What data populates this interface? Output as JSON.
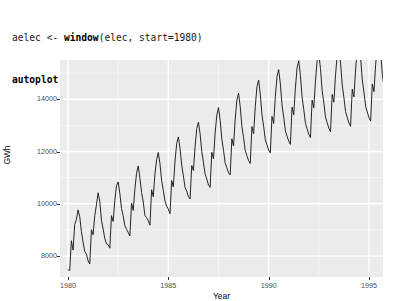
{
  "code": {
    "lines": [
      [
        {
          "t": "plain",
          "v": "aelec "
        },
        {
          "t": "op",
          "v": "<- "
        },
        {
          "t": "fn",
          "v": "window"
        },
        {
          "t": "plain",
          "v": "(elec, start=1980)"
        }
      ],
      [
        {
          "t": "fn",
          "v": "autoplot"
        },
        {
          "t": "plain",
          "v": "(aelec) "
        },
        {
          "t": "op",
          "v": "+ "
        },
        {
          "t": "fn",
          "v": "xlab"
        },
        {
          "t": "plain",
          "v": "("
        },
        {
          "t": "str",
          "v": "\"Year\""
        },
        {
          "t": "plain",
          "v": ") "
        },
        {
          "t": "op",
          "v": "+ "
        },
        {
          "t": "fn",
          "v": "ylab"
        },
        {
          "t": "plain",
          "v": "("
        },
        {
          "t": "str",
          "v": "\"GWh\""
        },
        {
          "t": "plain",
          "v": ")"
        }
      ]
    ],
    "line1_text": "aelec <- window(elec, start=1980)",
    "line2_text": "autoplot(aelec) + xlab(\"Year\") + ylab(\"GWh\")"
  },
  "colors": {
    "panel_background": "#ebebeb",
    "gridline_major": "#ffffff",
    "gridline_minor": "#f5f5f5",
    "series_line": "#1a1a1a",
    "axis_text": "#4d4d4d",
    "axis_title": "#000000",
    "code_string": "#9a9a9a",
    "code_text": "#1a1a1a",
    "page_background": "#ffffff"
  },
  "chart_data": {
    "type": "line",
    "title": "",
    "subtitle": "",
    "xlabel": "Year",
    "ylabel": "GWh",
    "xlim": [
      1979.6,
      1995.7
    ],
    "ylim": [
      7200,
      15500
    ],
    "xticks": [
      1980,
      1985,
      1990,
      1995
    ],
    "xtick_labels": [
      "1980",
      "1985",
      "1990",
      "1995"
    ],
    "yticks": [
      8000,
      10000,
      12000,
      14000
    ],
    "ytick_labels": [
      "8000",
      "10000",
      "12000",
      "14000"
    ],
    "xminor_ticks": [
      1982.5,
      1987.5,
      1992.5
    ],
    "yminor_ticks": [
      9000,
      11000,
      13000,
      15000
    ],
    "grid": true,
    "legend": "none",
    "theme": "theme_grey",
    "series": [
      {
        "name": "aelec",
        "color": "#1a1a1a",
        "x_start": 1980.0,
        "x_step": 0.0833333,
        "values": [
          7474,
          7454,
          8587,
          8230,
          9207,
          9405,
          9767,
          9507,
          8946,
          8537,
          8178,
          8078,
          7818,
          7697,
          9010,
          8818,
          9548,
          9961,
          10421,
          10087,
          9370,
          9035,
          8673,
          8472,
          8434,
          8301,
          9547,
          9322,
          10135,
          10698,
          10836,
          10391,
          9821,
          9538,
          9161,
          9024,
          8908,
          8768,
          10023,
          9745,
          10575,
          11167,
          11448,
          10985,
          10436,
          10065,
          9550,
          9473,
          9352,
          9183,
          10538,
          10272,
          11144,
          11685,
          11960,
          11531,
          10887,
          10510,
          10099,
          9913,
          9796,
          9618,
          10890,
          10643,
          11637,
          12308,
          12558,
          12113,
          11472,
          11068,
          10625,
          10483,
          10285,
          10183,
          11467,
          11269,
          12184,
          12874,
          13120,
          12678,
          11994,
          11588,
          11128,
          10952,
          10719,
          10628,
          11967,
          11720,
          12716,
          13392,
          13680,
          13193,
          12474,
          12051,
          11556,
          11379,
          11183,
          11105,
          12487,
          12216,
          13243,
          13971,
          14230,
          13712,
          12968,
          12530,
          12037,
          11838,
          11654,
          11542,
          12953,
          12681,
          13711,
          14480,
          14733,
          14188,
          13406,
          12965,
          12453,
          12246,
          12059,
          11949,
          13344,
          13072,
          14094,
          14873,
          15134,
          14588,
          13775,
          13316,
          12793,
          12589,
          12398,
          12272,
          13697,
          13406,
          14432,
          15205,
          15470,
          14908,
          14081,
          13615,
          13079,
          12869,
          12663,
          12531,
          13963,
          13671,
          14699,
          15477,
          15735,
          15172,
          14334,
          13862,
          13318,
          13103,
          12892,
          12758,
          14182,
          13889,
          14917,
          15693,
          15951,
          15388,
          14547,
          14073,
          13527,
          13311,
          13099,
          12962,
          14384,
          14090,
          15118,
          15894,
          16152,
          15589,
          14748,
          14274,
          13728,
          13512,
          13300,
          13162,
          14585,
          14290,
          15318,
          16094,
          16352,
          15789,
          14948,
          14474,
          13928,
          13712
        ]
      }
    ]
  }
}
